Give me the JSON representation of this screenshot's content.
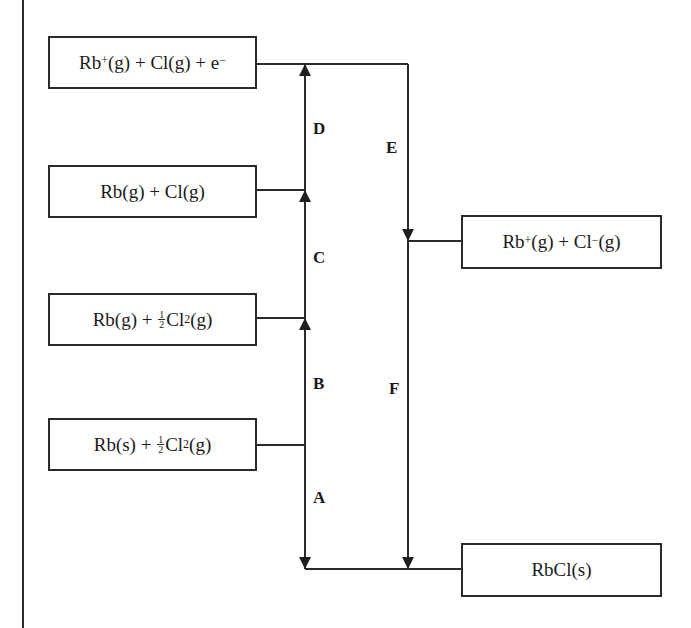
{
  "diagram": {
    "type": "Born-Haber cycle",
    "compound": "RbCl",
    "levels": [
      {
        "id": "ionized_gas_atoms",
        "label_parts": {
          "a": "Rb",
          "a_sup": "+",
          "b": "(g) + Cl(g) + e",
          "b_sup": "−"
        }
      },
      {
        "id": "gaseous_atoms",
        "label": "Rb(g) + Cl(g)"
      },
      {
        "id": "gaseous_rb_chlorine",
        "label_parts": {
          "a": "Rb(g) + ",
          "num": "1",
          "den": "2",
          "b": "Cl",
          "sub": "2",
          "c": "(g)"
        }
      },
      {
        "id": "standard_elements",
        "label_parts": {
          "a": "Rb(s) + ",
          "num": "1",
          "den": "2",
          "b": "Cl",
          "sub": "2",
          "c": "(g)"
        }
      },
      {
        "id": "gaseous_ions",
        "label_parts": {
          "a": "Rb",
          "a_sup": "+",
          "b": "(g) + Cl",
          "b_sup": "−",
          "c": "(g)"
        }
      },
      {
        "id": "ionic_solid",
        "label": "RbCl(s)"
      }
    ],
    "steps": [
      {
        "label": "A",
        "from": "standard_elements",
        "to": "ionic_solid",
        "direction": "down"
      },
      {
        "label": "B",
        "from": "standard_elements",
        "to": "gaseous_rb_chlorine",
        "direction": "up"
      },
      {
        "label": "C",
        "from": "gaseous_rb_chlorine",
        "to": "gaseous_atoms",
        "direction": "up"
      },
      {
        "label": "D",
        "from": "gaseous_atoms",
        "to": "ionized_gas_atoms",
        "direction": "up"
      },
      {
        "label": "E",
        "from": "ionized_gas_atoms",
        "to": "gaseous_ions",
        "direction": "down"
      },
      {
        "label": "F",
        "from": "gaseous_ions",
        "to": "ionic_solid",
        "direction": "down"
      }
    ],
    "line_color": "#2a2a2a"
  }
}
